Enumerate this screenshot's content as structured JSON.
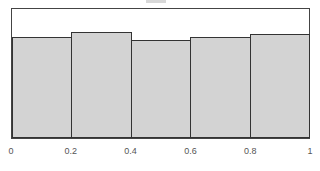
{
  "chart_data": {
    "type": "bar",
    "title": "",
    "xlabel": "",
    "ylabel": "",
    "categories": [
      "0-0.2",
      "0.2-0.4",
      "0.4-0.6",
      "0.6-0.8",
      "0.8-1"
    ],
    "bin_edges": [
      0,
      0.2,
      0.4,
      0.6,
      0.8,
      1
    ],
    "values": [
      0.78,
      0.82,
      0.76,
      0.78,
      0.81
    ],
    "xlim": [
      0,
      1
    ],
    "ylim": [
      0,
      1
    ],
    "grid": false,
    "x_tick_labels": [
      "0",
      "0.2",
      "0.4",
      "0.6",
      "0.8",
      "1"
    ],
    "bar_color": "#d3d3d3",
    "edge_color": "#333333"
  }
}
